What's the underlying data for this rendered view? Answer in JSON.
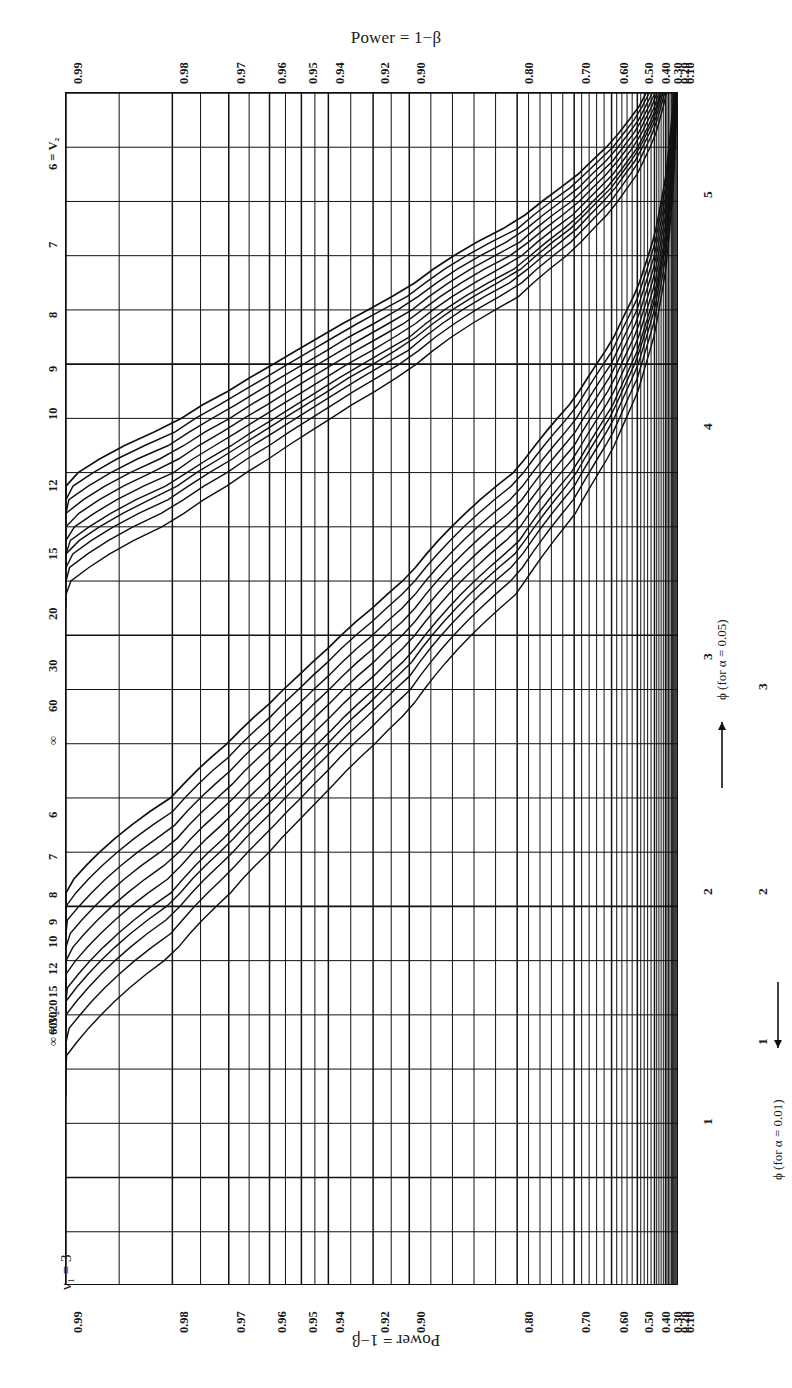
{
  "figure": {
    "top_title": "Power = 1−β",
    "bottom_title": "Power = 1−β",
    "nu1_label": "ν₁ = 3",
    "alpha_labels": [
      "α = 0.01",
      "α = 0.05"
    ],
    "phi_axis_005": "ϕ (for α = 0.05)",
    "phi_axis_001": "ϕ (for α = 0.01)",
    "ink": "#111111"
  },
  "chart_data": {
    "type": "line",
    "title": "Power = 1−β",
    "subtitle": "Pearson–Hartley power curves for the analysis of variance, ν₁ = 3",
    "orientation": "rotated-90",
    "xlabel": "Power = 1−β",
    "ylabel": "ϕ (for α = 0.05) / ϕ (for α = 0.01)",
    "grid": true,
    "legend_position": "inline-curve-labels",
    "power_ticks": [
      0.99,
      0.98,
      0.97,
      0.96,
      0.95,
      0.94,
      0.92,
      0.9,
      0.8,
      0.7,
      0.6,
      0.5,
      0.4,
      0.3,
      0.2,
      0.1
    ],
    "power_tick_labels": [
      "0.99",
      "0.98",
      "0.97",
      "0.96",
      "0.95",
      "0.94",
      "0.92",
      "0.90",
      "0.80",
      "0.70",
      "0.60",
      "0.50",
      "0.40",
      "0.30",
      "0.20",
      "0.10"
    ],
    "power_minor_ticks": [
      0.985,
      0.975,
      0.965,
      0.955,
      0.945,
      0.93,
      0.91,
      0.88,
      0.86,
      0.84,
      0.82,
      0.78,
      0.76,
      0.74,
      0.72,
      0.68,
      0.66,
      0.64,
      0.62,
      0.58,
      0.56,
      0.54,
      0.52,
      0.48,
      0.46,
      0.44,
      0.42,
      0.38,
      0.36,
      0.34,
      0.32,
      0.28,
      0.26,
      0.24,
      0.22,
      0.18,
      0.16,
      0.14,
      0.12
    ],
    "phi_scale_005": {
      "label": "ϕ (for α = 0.05)",
      "ticks": [
        1,
        2,
        3,
        4,
        5
      ],
      "tick_labels": [
        "1",
        "2",
        "3",
        "4",
        "5"
      ],
      "range": [
        1,
        5.4
      ],
      "minor_step": 0.2
    },
    "phi_scale_001": {
      "label": "ϕ (for α = 0.01)",
      "ticks": [
        1,
        2,
        3
      ],
      "tick_labels": [
        "1",
        "2",
        "3"
      ],
      "range": [
        1,
        3.4
      ],
      "minor_step": 0.2
    },
    "curve_families": [
      {
        "alpha": 0.05,
        "alpha_label": "α = 0.05",
        "series_label_prefix": "ν₂",
        "nu2_values": [
          "6",
          "7",
          "8",
          "9",
          "10",
          "12",
          "15",
          "20",
          "30",
          "60",
          "∞"
        ],
        "left_margin_labels": [
          "6 = V₂",
          "7",
          "8",
          "9",
          "10",
          "12",
          "15",
          "20",
          "30",
          "60",
          "∞"
        ],
        "inline_labels": [
          "V₂ = ∞",
          "60",
          "30",
          "20",
          "15",
          "12",
          "10",
          "9",
          "8",
          "7",
          "6 = V₂"
        ]
      },
      {
        "alpha": 0.01,
        "alpha_label": "α = 0.01",
        "series_label_prefix": "ν₂",
        "nu2_values": [
          "6",
          "7",
          "8",
          "9",
          "10",
          "12",
          "15",
          "20",
          "30",
          "60",
          "∞"
        ],
        "left_margin_labels": [
          "6",
          "7",
          "8",
          "9",
          "10",
          "12",
          "15",
          "20",
          "30",
          "60",
          "∞ = V₂"
        ],
        "inline_labels": [
          "∞",
          "60",
          "30",
          "20",
          "15",
          "12",
          "10",
          "9",
          "8",
          "7",
          "6 = V₂"
        ]
      }
    ]
  },
  "ticks_top": [
    {
      "label": "0.99",
      "pos": 0.0
    },
    {
      "label": "0.98",
      "pos": 0.1735
    },
    {
      "label": "0.97",
      "pos": 0.2655
    },
    {
      "label": "0.96",
      "pos": 0.332
    },
    {
      "label": "0.95",
      "pos": 0.384
    },
    {
      "label": "0.94",
      "pos": 0.428
    },
    {
      "label": "0.92",
      "pos": 0.501
    },
    {
      "label": "0.90",
      "pos": 0.56
    },
    {
      "label": "0.80",
      "pos": 0.736
    },
    {
      "label": "0.70",
      "pos": 0.829
    },
    {
      "label": "0.60",
      "pos": 0.89
    },
    {
      "label": "0.50",
      "pos": 0.932
    },
    {
      "label": "0.40",
      "pos": 0.96
    },
    {
      "label": "0.30",
      "pos": 0.978
    },
    {
      "label": "0.20",
      "pos": 0.99
    },
    {
      "label": "0.10",
      "pos": 0.998
    }
  ],
  "phi_ticks_005": [
    {
      "label": "1",
      "pos": 0.0
    },
    {
      "label": "2",
      "pos": 0.25
    },
    {
      "label": "3",
      "pos": 0.5
    },
    {
      "label": "4",
      "pos": 0.75
    },
    {
      "label": "5",
      "pos": 1.0
    }
  ],
  "phi_ticks_001": [
    {
      "label": "1",
      "pos": 0.0
    },
    {
      "label": "2",
      "pos": 0.3906
    },
    {
      "label": "3",
      "pos": 0.7812
    }
  ],
  "left_labels_a": [
    "6 = V₂",
    "7",
    "8",
    "9",
    "10",
    "12",
    "15",
    "20",
    "30",
    "60",
    "∞"
  ],
  "left_labels_b": [
    "6",
    "7",
    "8",
    "9",
    "10",
    "12",
    "15",
    "20",
    "30",
    "60",
    "∞ = V₂"
  ],
  "inline_labels_a": [
    "6 = V₂",
    "7",
    "8",
    "9",
    "10",
    "12",
    "15",
    "20",
    "30",
    "60",
    "∞"
  ],
  "inline_labels_b": [
    "6 = V₂",
    "7",
    "8",
    "9",
    "10",
    "12",
    "15",
    "20",
    "30",
    "60",
    "∞"
  ]
}
